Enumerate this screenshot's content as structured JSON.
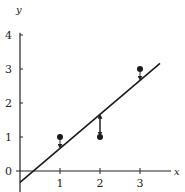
{
  "chart_data": {
    "type": "scatter",
    "title": "",
    "xlabel": "x",
    "ylabel": "y",
    "xlim": [
      -0.05,
      3.7
    ],
    "ylim": [
      -0.4,
      4.3
    ],
    "x_ticks": [
      "1",
      "2",
      "3"
    ],
    "y_ticks": [
      "0",
      "1",
      "2",
      "3",
      "4"
    ],
    "x_tick_values": [
      1,
      2,
      3
    ],
    "y_tick_values": [
      0,
      1,
      2,
      3,
      4
    ],
    "grid": false,
    "points": [
      {
        "x": 1,
        "y": 1
      },
      {
        "x": 2,
        "y": 1
      },
      {
        "x": 3,
        "y": 3
      }
    ],
    "fit_line": {
      "slope": 1,
      "intercept": -0.3333,
      "x_range": [
        0,
        3.5
      ]
    },
    "residuals": [
      {
        "x": 1,
        "from": 1,
        "to": 0.6667
      },
      {
        "x": 2,
        "from": 1,
        "to": 1.6667
      },
      {
        "x": 3,
        "from": 3,
        "to": 2.6667
      }
    ]
  }
}
